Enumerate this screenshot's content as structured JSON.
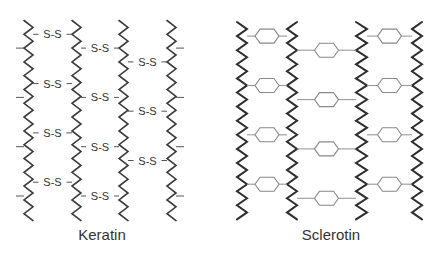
{
  "panels": [
    {
      "label": "Keratin",
      "bridge_text": "S-S",
      "bridge_type": "disulfide",
      "chain_count": 4
    },
    {
      "label": "Sclerotin",
      "bridge_type": "aromatic-ring (hexagon)",
      "chain_count": 4
    }
  ],
  "colors": {
    "chain": "#3a3a3a",
    "disulfide_text": "#333333",
    "hexagon": "#888888",
    "background": "#ffffff"
  }
}
